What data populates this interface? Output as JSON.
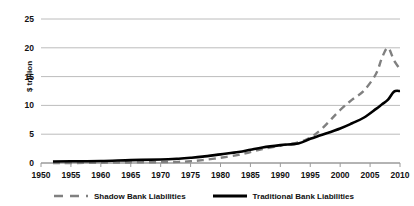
{
  "chart_data": {
    "type": "line",
    "title": "",
    "xlabel": "",
    "ylabel": "$ trillion",
    "xlim": [
      1950,
      2010
    ],
    "ylim": [
      0,
      25
    ],
    "grid": true,
    "legend_position": "bottom",
    "xticks": [
      "1950",
      "1955",
      "1960",
      "1965",
      "1970",
      "1975",
      "1980",
      "1985",
      "1990",
      "1995",
      "2000",
      "2005",
      "2010"
    ],
    "yticks": [
      "0",
      "5",
      "10",
      "15",
      "20",
      "25"
    ],
    "x": [
      1952,
      1955,
      1960,
      1965,
      1970,
      1973,
      1975,
      1977,
      1980,
      1983,
      1985,
      1987,
      1990,
      1993,
      1995,
      1997,
      2000,
      2002,
      2004,
      2006,
      2007,
      2008,
      2009,
      2010
    ],
    "series": [
      {
        "name": "Shadow Bank Liabilities",
        "style": "dashed",
        "color": "#808080",
        "values": [
          0.0,
          0.0,
          0.05,
          0.1,
          0.15,
          0.2,
          0.3,
          0.5,
          0.9,
          1.4,
          1.9,
          2.4,
          3.0,
          3.6,
          4.4,
          6.0,
          9.2,
          11.0,
          12.6,
          15.5,
          18.3,
          20.0,
          17.8,
          16.3
        ]
      },
      {
        "name": "Traditional Bank Liabilities",
        "style": "solid",
        "color": "#000000",
        "values": [
          0.25,
          0.3,
          0.35,
          0.5,
          0.6,
          0.75,
          0.9,
          1.1,
          1.5,
          1.9,
          2.3,
          2.7,
          3.1,
          3.4,
          4.2,
          4.9,
          6.0,
          6.9,
          7.9,
          9.4,
          10.2,
          11.0,
          12.4,
          12.5
        ]
      }
    ]
  },
  "legend": {
    "items": [
      {
        "label": "Shadow Bank Liabilities",
        "style": "dashed"
      },
      {
        "label": "Traditional Bank Liabilities",
        "style": "solid"
      }
    ]
  }
}
